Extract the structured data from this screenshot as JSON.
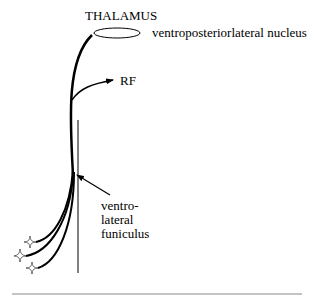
{
  "diagram": {
    "title": "THALAMUS",
    "labels": {
      "thalamus": "THALAMUS",
      "vpl_nucleus": "ventroposteriorlateral nucleus",
      "rf": "RF",
      "vlf_line1": "ventro-",
      "vlf_line2": "lateral",
      "vlf_line3": "funiculus"
    },
    "nodes": [
      {
        "id": "vpl",
        "shape": "ellipse",
        "label": "ventroposteriorlateral nucleus"
      },
      {
        "id": "rf",
        "shape": "arrow-target",
        "label": "RF"
      },
      {
        "id": "receptor-1",
        "shape": "star-icon"
      },
      {
        "id": "receptor-2",
        "shape": "star-icon"
      },
      {
        "id": "receptor-3",
        "shape": "star-icon"
      }
    ],
    "edges": [
      {
        "from": "receptors",
        "to": "vpl",
        "label": "main tract"
      },
      {
        "from": "tract",
        "to": "rf",
        "label": "collateral"
      }
    ],
    "annotations": [
      {
        "text": "ventro-lateral funiculus",
        "points_to": "tract"
      }
    ],
    "colors": {
      "stroke": "#000000",
      "background": "#ffffff",
      "rule": "#888888"
    }
  }
}
